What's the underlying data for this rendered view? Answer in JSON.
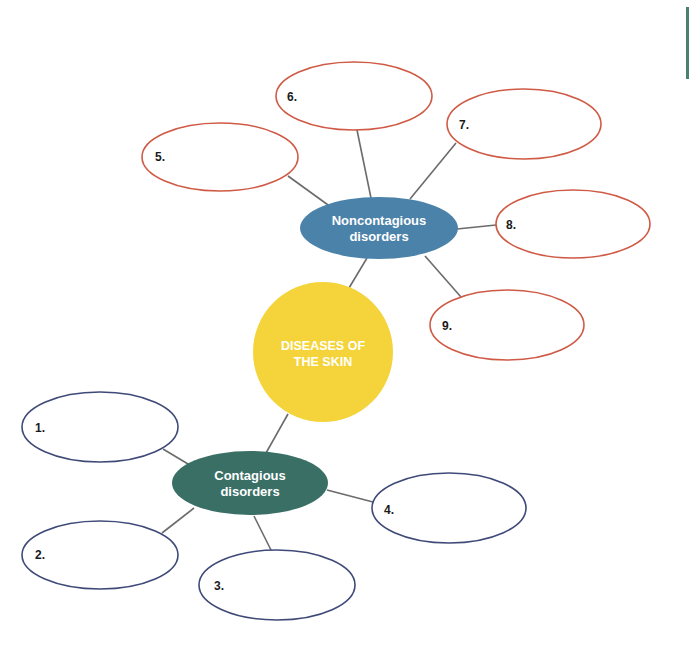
{
  "colors": {
    "center_fill": "#f4d43a",
    "noncontagious_fill": "#4b82a9",
    "contagious_fill": "#3a6f66",
    "noncontagious_outline": "#cf5a45",
    "contagious_outline": "#3f4a78",
    "connector": "#6b6b6b",
    "edge_bar": "#4a7f72"
  },
  "center": {
    "line1": "DISEASES OF",
    "line2": "THE SKIN"
  },
  "noncontagious": {
    "line1": "Noncontagious",
    "line2": "disorders",
    "blanks": [
      {
        "number": "5."
      },
      {
        "number": "6."
      },
      {
        "number": "7."
      },
      {
        "number": "8."
      },
      {
        "number": "9."
      }
    ]
  },
  "contagious": {
    "line1": "Contagious",
    "line2": "disorders",
    "blanks": [
      {
        "number": "1."
      },
      {
        "number": "2."
      },
      {
        "number": "3."
      },
      {
        "number": "4."
      }
    ]
  }
}
